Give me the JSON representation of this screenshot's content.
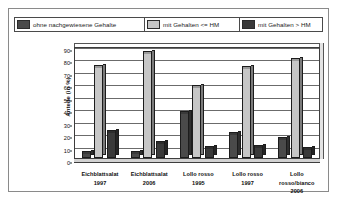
{
  "chart_data": {
    "type": "bar",
    "title": "",
    "subtitle": "",
    "xlabel": "",
    "ylabel": "Anteile (in %)",
    "ylim": [
      0,
      90
    ],
    "ytick_step": 10,
    "yticks": [
      "0",
      "10",
      "20",
      "30",
      "40",
      "50",
      "60",
      "70",
      "80",
      "90"
    ],
    "grid": true,
    "legend_position": "top",
    "categories": [
      "Eichblattsalat 1997",
      "Eichblattsalat 2006",
      "Lollo rosso 1995",
      "Lollo rosso 1997",
      "Lollo rosso/bianco 2006"
    ],
    "category_lines": [
      [
        "Eichblattsalat",
        "1997"
      ],
      [
        "Eichblattsalat",
        "2006"
      ],
      [
        "Lollo rosso",
        "1995"
      ],
      [
        "Lollo rosso",
        "1997"
      ],
      [
        "Lollo",
        "rosso/bianco",
        "2006"
      ]
    ],
    "series": [
      {
        "name": "ohne nachgewiesene Gehalte",
        "color": "#4a4a4a",
        "values": [
          4,
          4,
          36,
          19,
          15
        ]
      },
      {
        "name": "mit Gehalten <= HM",
        "color": "#c6c6c6",
        "values": [
          73,
          84,
          57,
          72,
          79
        ]
      },
      {
        "name": "mit Gehalten > HM",
        "color": "#3a3a3a",
        "values": [
          21,
          12,
          8,
          9,
          7
        ]
      }
    ]
  },
  "legend": {
    "items": [
      {
        "label": "ohne nachgewiesene Gehalte",
        "color": "#4a4a4a"
      },
      {
        "label": "mit Gehalten <= HM",
        "color": "#c6c6c6"
      },
      {
        "label": "mit Gehalten > HM",
        "color": "#3a3a3a"
      }
    ]
  }
}
